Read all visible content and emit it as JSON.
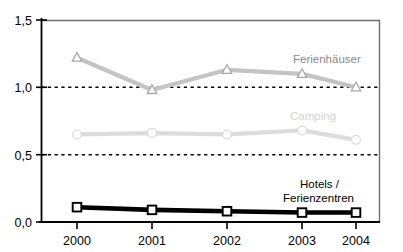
{
  "chart_data": {
    "type": "line",
    "title": "",
    "subtitle": "",
    "xlabel": "",
    "ylabel": "",
    "categories": [
      "2000",
      "2001",
      "2002",
      "2003",
      "2004"
    ],
    "x": [
      2000,
      2001,
      2002,
      2003,
      2004
    ],
    "ylim": [
      0.0,
      1.5
    ],
    "y_ticks": [
      0.0,
      0.5,
      1.0,
      1.5
    ],
    "y_tick_labels": [
      "0,0",
      "0,5",
      "1,0",
      "1,5"
    ],
    "gridlines": {
      "horizontal_dotted_at": [
        0.5,
        1.0
      ],
      "grid": true,
      "style": "dotted"
    },
    "legend": {
      "position": "inline-annotations",
      "entries": [
        "Ferienhäuser",
        "Camping",
        "Hotels / Ferienzentren"
      ]
    },
    "series": [
      {
        "name": "Ferienhäuser",
        "label": "Ferienhäuser",
        "marker": "triangle",
        "color": "#c4c4c4",
        "label_color": "#8a8a8a",
        "values": [
          1.22,
          0.98,
          1.13,
          1.1,
          1.0
        ]
      },
      {
        "name": "Camping",
        "label": "Camping",
        "marker": "circle",
        "color": "#dcdcdc",
        "label_color": "#d2d2d2",
        "values": [
          0.65,
          0.66,
          0.65,
          0.68,
          0.61
        ]
      },
      {
        "name": "Hotels / Ferienzentren",
        "label_line1": "Hotels /",
        "label_line2": "Ferienzentren",
        "marker": "square",
        "color": "#000000",
        "label_color": "#000000",
        "values": [
          0.11,
          0.09,
          0.08,
          0.07,
          0.07
        ]
      }
    ],
    "annotations": [
      {
        "text": "Ferienhäuser",
        "x": 2003.05,
        "y": 1.22
      },
      {
        "text": "Camping",
        "x": 2002.85,
        "y": 0.8
      },
      {
        "text": "Hotels /",
        "x": 2003.15,
        "y": 0.3
      },
      {
        "text": "Ferienzentren",
        "x": 2003.15,
        "y": 0.2
      }
    ],
    "axis_colors": {
      "left_axis": "#000000",
      "bottom_axis": "#000000",
      "top_border": "#7a7a7a",
      "right_border": "#7a7a7a",
      "gridline": "#000000"
    }
  }
}
